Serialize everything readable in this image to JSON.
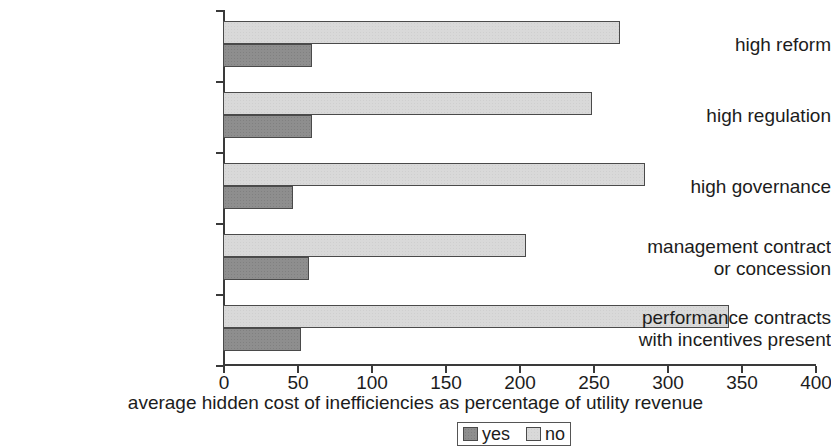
{
  "chart_data": {
    "type": "bar",
    "orientation": "horizontal",
    "title": "",
    "xlabel": "average hidden cost of inefficiencies as percentage of utility revenue",
    "ylabel": "",
    "xlim": [
      0,
      400
    ],
    "xticks": [
      0,
      50,
      100,
      150,
      200,
      250,
      300,
      350,
      400
    ],
    "xtick_labels": [
      "0",
      "50",
      "100",
      "150",
      "200",
      "250",
      "300",
      "350",
      "400"
    ],
    "grid": false,
    "legend_position": "bottom-center",
    "categories": [
      "high reform",
      "high regulation",
      "high governance",
      "management contract\nor concession",
      "performance contracts\nwith incentives present"
    ],
    "series": [
      {
        "name": "no",
        "color": "#d9d9d9",
        "values": [
          268,
          249,
          285,
          205,
          342
        ]
      },
      {
        "name": "yes",
        "color": "#8e8e8e",
        "values": [
          60,
          60,
          47,
          58,
          53
        ]
      }
    ]
  },
  "legend": {
    "items": [
      {
        "label": "yes",
        "swatch": "yes"
      },
      {
        "label": "no",
        "swatch": "no"
      }
    ]
  },
  "colors": {
    "axis": "#3a3a3a",
    "text": "#1c1c1c",
    "bar_no": "#d9d9d9",
    "bar_yes": "#8e8e8e",
    "bar_border": "#4a4a4a",
    "background": "#ffffff"
  }
}
